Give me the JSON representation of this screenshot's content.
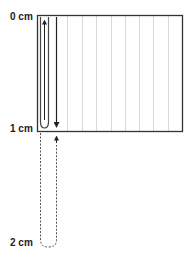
{
  "labels": {
    "zero": "0 cm",
    "one": "1 cm",
    "two": "2 cm"
  },
  "colors": {
    "border": "#333333",
    "grid_line": "#d8d8d8",
    "tube": "#444444",
    "arrow": "#222222",
    "dashed": "#555555"
  },
  "diagram": {
    "box": {
      "x": 37,
      "y": 15,
      "width": 146,
      "height": 117
    },
    "grid_lines_x": [
      67,
      82,
      96,
      111,
      125,
      139,
      153,
      168
    ],
    "scale_marks": [
      {
        "label": "0 cm",
        "y": 15
      },
      {
        "label": "1 cm",
        "y": 132
      },
      {
        "label": "2 cm",
        "y": 247
      }
    ],
    "arrows": [
      {
        "direction": "up",
        "x": 47,
        "from_y": 120,
        "to_y": 20
      },
      {
        "direction": "down",
        "x": 56,
        "from_y": 20,
        "to_y": 127
      },
      {
        "direction": "up",
        "x": 56,
        "from_y": 245,
        "to_y": 137
      }
    ]
  }
}
